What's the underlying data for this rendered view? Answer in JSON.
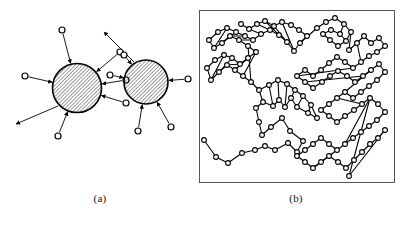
{
  "figure": {
    "title": "",
    "background_color": "#ffffff",
    "ink_color": "#000000",
    "width": 407,
    "height": 225
  },
  "captions": {
    "panel_a_label": "(a)",
    "panel_b_label": "(b)"
  },
  "panel_a": {
    "name": "hatched-particle-diagram",
    "description": "Two hatched disks with radiating arrow-connected small open circles",
    "hatch": {
      "angle_deg": 45,
      "spacing_px": 2.6,
      "stroke_width": 0.7,
      "color": "#000000"
    },
    "disks": [
      {
        "id": "disk-1",
        "cx": 77,
        "cy": 88,
        "r": 24.5,
        "stroke_width": 1.6,
        "satellites": [
          {
            "id": "s1-1",
            "cx": 62,
            "cy": 30,
            "r": 3.0,
            "arrow": "inward"
          },
          {
            "id": "s1-2",
            "cx": 120,
            "cy": 52,
            "r": 3.0,
            "arrow": "inward"
          },
          {
            "id": "s1-3",
            "cx": 126,
            "cy": 80,
            "r": 3.0,
            "arrow": "inward"
          },
          {
            "id": "s1-4",
            "cx": 126,
            "cy": 103,
            "r": 3.0,
            "arrow": "inward"
          },
          {
            "id": "s1-5",
            "cx": 25,
            "cy": 76,
            "r": 3.0,
            "arrow": "inward"
          },
          {
            "id": "s1-6",
            "cx": 58,
            "cy": 136,
            "r": 3.0,
            "arrow": "inward"
          }
        ],
        "free_arrows": [
          {
            "id": "f1-1",
            "x1": 58,
            "y1": 106,
            "x2": 16,
            "y2": 124
          }
        ]
      },
      {
        "id": "disk-2",
        "cx": 146,
        "cy": 82,
        "r": 22.0,
        "stroke_width": 1.6,
        "satellites": [
          {
            "id": "s2-1",
            "cx": 124,
            "cy": 55,
            "r": 3.0,
            "arrow": "inward"
          },
          {
            "id": "s2-2",
            "cx": 110,
            "cy": 75,
            "r": 3.0,
            "arrow": "inward"
          },
          {
            "id": "s2-3",
            "cx": 188,
            "cy": 79,
            "r": 3.0,
            "arrow": "inward"
          },
          {
            "id": "s2-4",
            "cx": 138,
            "cy": 131,
            "r": 3.0,
            "arrow": "inward"
          },
          {
            "id": "s2-5",
            "cx": 171,
            "cy": 127,
            "r": 3.0,
            "arrow": "inward"
          }
        ],
        "free_arrows": [
          {
            "id": "f2-1",
            "x1": 134,
            "y1": 62,
            "x2": 104,
            "y2": 32
          }
        ]
      }
    ]
  },
  "panel_b": {
    "name": "node-link-network-plot",
    "description": "Bounded rectangular frame containing a node-link graph of small open circles joined by straight segments",
    "frame": {
      "x": 0,
      "y": 0,
      "width": 196,
      "height": 173,
      "stroke": "#555555",
      "stroke_width": 1.0,
      "fill": "#ffffff"
    },
    "node_style": {
      "r": 2.4,
      "fill": "#ffffff",
      "stroke": "#000000",
      "stroke_width": 1.1
    },
    "edge_style": {
      "stroke": "#000000",
      "stroke_width": 1.1
    },
    "node_count": 148,
    "nodes": [
      [
        5,
        130
      ],
      [
        17,
        147
      ],
      [
        29,
        153
      ],
      [
        43,
        143
      ],
      [
        56,
        140
      ],
      [
        66,
        136
      ],
      [
        76,
        140
      ],
      [
        89,
        133
      ],
      [
        98,
        142
      ],
      [
        104,
        131
      ],
      [
        91,
        121
      ],
      [
        83,
        108
      ],
      [
        72,
        117
      ],
      [
        63,
        125
      ],
      [
        60,
        112
      ],
      [
        57,
        98
      ],
      [
        64,
        92
      ],
      [
        74,
        96
      ],
      [
        80,
        90
      ],
      [
        86,
        97
      ],
      [
        92,
        88
      ],
      [
        98,
        97
      ],
      [
        109,
        103
      ],
      [
        118,
        108
      ],
      [
        112,
        95
      ],
      [
        104,
        86
      ],
      [
        96,
        80
      ],
      [
        88,
        74
      ],
      [
        79,
        70
      ],
      [
        70,
        75
      ],
      [
        60,
        80
      ],
      [
        52,
        72
      ],
      [
        44,
        66
      ],
      [
        36,
        60
      ],
      [
        28,
        55
      ],
      [
        20,
        62
      ],
      [
        12,
        70
      ],
      [
        8,
        58
      ],
      [
        16,
        50
      ],
      [
        25,
        45
      ],
      [
        33,
        48
      ],
      [
        41,
        54
      ],
      [
        49,
        48
      ],
      [
        57,
        42
      ],
      [
        49,
        36
      ],
      [
        40,
        30
      ],
      [
        31,
        26
      ],
      [
        23,
        33
      ],
      [
        15,
        38
      ],
      [
        10,
        30
      ],
      [
        19,
        22
      ],
      [
        28,
        18
      ],
      [
        37,
        22
      ],
      [
        46,
        26
      ],
      [
        54,
        30
      ],
      [
        62,
        24
      ],
      [
        71,
        20
      ],
      [
        80,
        25
      ],
      [
        88,
        32
      ],
      [
        95,
        41
      ],
      [
        101,
        33
      ],
      [
        108,
        26
      ],
      [
        100,
        20
      ],
      [
        92,
        15
      ],
      [
        83,
        12
      ],
      [
        75,
        16
      ],
      [
        66,
        11
      ],
      [
        58,
        14
      ],
      [
        50,
        19
      ],
      [
        42,
        14
      ],
      [
        118,
        18
      ],
      [
        127,
        12
      ],
      [
        136,
        8
      ],
      [
        145,
        14
      ],
      [
        152,
        22
      ],
      [
        147,
        31
      ],
      [
        139,
        36
      ],
      [
        131,
        30
      ],
      [
        124,
        24
      ],
      [
        132,
        20
      ],
      [
        141,
        24
      ],
      [
        150,
        40
      ],
      [
        158,
        33
      ],
      [
        165,
        26
      ],
      [
        172,
        33
      ],
      [
        180,
        28
      ],
      [
        186,
        36
      ],
      [
        178,
        42
      ],
      [
        170,
        46
      ],
      [
        162,
        52
      ],
      [
        154,
        58
      ],
      [
        146,
        52
      ],
      [
        138,
        47
      ],
      [
        130,
        53
      ],
      [
        122,
        60
      ],
      [
        114,
        66
      ],
      [
        106,
        60
      ],
      [
        98,
        66
      ],
      [
        106,
        72
      ],
      [
        114,
        78
      ],
      [
        123,
        72
      ],
      [
        131,
        66
      ],
      [
        139,
        61
      ],
      [
        148,
        66
      ],
      [
        156,
        72
      ],
      [
        164,
        66
      ],
      [
        172,
        60
      ],
      [
        180,
        54
      ],
      [
        186,
        62
      ],
      [
        178,
        70
      ],
      [
        170,
        76
      ],
      [
        162,
        82
      ],
      [
        154,
        88
      ],
      [
        146,
        82
      ],
      [
        138,
        88
      ],
      [
        130,
        94
      ],
      [
        122,
        100
      ],
      [
        130,
        106
      ],
      [
        138,
        112
      ],
      [
        146,
        106
      ],
      [
        155,
        100
      ],
      [
        163,
        94
      ],
      [
        171,
        88
      ],
      [
        179,
        94
      ],
      [
        186,
        102
      ],
      [
        178,
        110
      ],
      [
        170,
        116
      ],
      [
        162,
        122
      ],
      [
        154,
        128
      ],
      [
        146,
        134
      ],
      [
        138,
        140
      ],
      [
        130,
        134
      ],
      [
        122,
        128
      ],
      [
        114,
        134
      ],
      [
        106,
        140
      ],
      [
        98,
        146
      ],
      [
        106,
        152
      ],
      [
        114,
        158
      ],
      [
        122,
        152
      ],
      [
        130,
        146
      ],
      [
        139,
        152
      ],
      [
        147,
        158
      ],
      [
        155,
        150
      ],
      [
        163,
        142
      ],
      [
        171,
        134
      ],
      [
        179,
        128
      ],
      [
        186,
        120
      ],
      [
        150,
        166
      ]
    ],
    "edges": [
      [
        0,
        1
      ],
      [
        1,
        2
      ],
      [
        2,
        3
      ],
      [
        3,
        4
      ],
      [
        4,
        5
      ],
      [
        5,
        6
      ],
      [
        6,
        7
      ],
      [
        7,
        8
      ],
      [
        8,
        9
      ],
      [
        9,
        10
      ],
      [
        10,
        11
      ],
      [
        11,
        12
      ],
      [
        12,
        13
      ],
      [
        13,
        14
      ],
      [
        14,
        15
      ],
      [
        15,
        16
      ],
      [
        16,
        17
      ],
      [
        17,
        18
      ],
      [
        18,
        19
      ],
      [
        19,
        20
      ],
      [
        20,
        21
      ],
      [
        21,
        22
      ],
      [
        22,
        23
      ],
      [
        23,
        24
      ],
      [
        24,
        25
      ],
      [
        25,
        26
      ],
      [
        26,
        27
      ],
      [
        27,
        28
      ],
      [
        28,
        29
      ],
      [
        29,
        30
      ],
      [
        30,
        31
      ],
      [
        31,
        32
      ],
      [
        32,
        33
      ],
      [
        33,
        34
      ],
      [
        34,
        35
      ],
      [
        35,
        36
      ],
      [
        36,
        37
      ],
      [
        37,
        38
      ],
      [
        38,
        39
      ],
      [
        39,
        40
      ],
      [
        40,
        41
      ],
      [
        41,
        42
      ],
      [
        42,
        43
      ],
      [
        43,
        44
      ],
      [
        44,
        45
      ],
      [
        45,
        46
      ],
      [
        46,
        47
      ],
      [
        47,
        48
      ],
      [
        48,
        49
      ],
      [
        49,
        50
      ],
      [
        50,
        51
      ],
      [
        51,
        52
      ],
      [
        52,
        53
      ],
      [
        53,
        54
      ],
      [
        54,
        55
      ],
      [
        55,
        56
      ],
      [
        56,
        57
      ],
      [
        57,
        58
      ],
      [
        58,
        59
      ],
      [
        59,
        60
      ],
      [
        60,
        61
      ],
      [
        61,
        62
      ],
      [
        62,
        63
      ],
      [
        63,
        64
      ],
      [
        64,
        65
      ],
      [
        65,
        66
      ],
      [
        66,
        67
      ],
      [
        67,
        68
      ],
      [
        68,
        69
      ],
      [
        60,
        70
      ],
      [
        70,
        71
      ],
      [
        71,
        72
      ],
      [
        72,
        73
      ],
      [
        73,
        74
      ],
      [
        74,
        75
      ],
      [
        75,
        76
      ],
      [
        76,
        77
      ],
      [
        77,
        78
      ],
      [
        78,
        79
      ],
      [
        79,
        80
      ],
      [
        80,
        73
      ],
      [
        74,
        81
      ],
      [
        81,
        82
      ],
      [
        82,
        83
      ],
      [
        83,
        84
      ],
      [
        84,
        85
      ],
      [
        85,
        86
      ],
      [
        86,
        87
      ],
      [
        87,
        88
      ],
      [
        88,
        89
      ],
      [
        89,
        90
      ],
      [
        90,
        91
      ],
      [
        91,
        92
      ],
      [
        92,
        93
      ],
      [
        93,
        94
      ],
      [
        94,
        95
      ],
      [
        95,
        96
      ],
      [
        96,
        97
      ],
      [
        97,
        98
      ],
      [
        98,
        99
      ],
      [
        99,
        100
      ],
      [
        100,
        101
      ],
      [
        101,
        102
      ],
      [
        102,
        103
      ],
      [
        103,
        104
      ],
      [
        104,
        105
      ],
      [
        105,
        106
      ],
      [
        106,
        107
      ],
      [
        107,
        108
      ],
      [
        108,
        109
      ],
      [
        109,
        110
      ],
      [
        110,
        111
      ],
      [
        111,
        112
      ],
      [
        112,
        113
      ],
      [
        113,
        114
      ],
      [
        114,
        115
      ],
      [
        115,
        116
      ],
      [
        116,
        117
      ],
      [
        117,
        118
      ],
      [
        118,
        119
      ],
      [
        119,
        120
      ],
      [
        120,
        121
      ],
      [
        121,
        122
      ],
      [
        122,
        123
      ],
      [
        123,
        124
      ],
      [
        124,
        125
      ],
      [
        125,
        126
      ],
      [
        126,
        127
      ],
      [
        127,
        128
      ],
      [
        128,
        129
      ],
      [
        129,
        130
      ],
      [
        130,
        131
      ],
      [
        131,
        132
      ],
      [
        132,
        133
      ],
      [
        133,
        134
      ],
      [
        134,
        135
      ],
      [
        135,
        136
      ],
      [
        136,
        137
      ],
      [
        137,
        138
      ],
      [
        138,
        139
      ],
      [
        139,
        140
      ],
      [
        140,
        141
      ],
      [
        141,
        142
      ],
      [
        142,
        143
      ],
      [
        143,
        144
      ],
      [
        144,
        145
      ],
      [
        145,
        146
      ],
      [
        146,
        147
      ],
      [
        147,
        122
      ],
      [
        16,
        30
      ],
      [
        17,
        29
      ],
      [
        18,
        28
      ],
      [
        19,
        27
      ],
      [
        20,
        26
      ],
      [
        21,
        25
      ],
      [
        22,
        24
      ],
      [
        31,
        44
      ],
      [
        32,
        43
      ],
      [
        33,
        42
      ],
      [
        34,
        41
      ],
      [
        35,
        40
      ],
      [
        36,
        39
      ],
      [
        45,
        54
      ],
      [
        46,
        53
      ],
      [
        47,
        52
      ],
      [
        48,
        51
      ],
      [
        55,
        68
      ],
      [
        56,
        67
      ],
      [
        57,
        66
      ],
      [
        58,
        65
      ],
      [
        59,
        64
      ],
      [
        75,
        80
      ],
      [
        82,
        89
      ],
      [
        90,
        97
      ],
      [
        98,
        105
      ],
      [
        106,
        113
      ],
      [
        114,
        121
      ],
      [
        122,
        129
      ],
      [
        130,
        137
      ]
    ]
  }
}
